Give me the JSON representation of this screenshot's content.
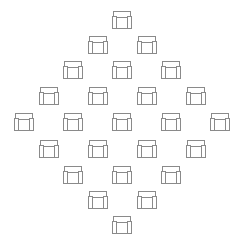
{
  "canvas": {
    "width": 245,
    "height": 237,
    "background_color": "#ffffff",
    "stroke_color": "#8a8a8a"
  },
  "pattern": {
    "name": "armchair-diamond-grid",
    "icon_semantic_name": "armchair-icon",
    "icon_count": 25,
    "rows_per_count": [
      1,
      2,
      3,
      4,
      5,
      4,
      3,
      2,
      1
    ],
    "column_spacing_px": 49,
    "row_spacing_px": 25,
    "icon_width_px": 22,
    "icon_height_px": 21,
    "center_x_px": 122,
    "first_row_y_px": 10
  },
  "icons": [
    {
      "id": "icon-r1-c1",
      "row": 1,
      "col": 1,
      "x": 111,
      "y": 10,
      "label": "armchair"
    },
    {
      "id": "icon-r2-c1",
      "row": 2,
      "col": 1,
      "x": 87,
      "y": 35,
      "label": "armchair"
    },
    {
      "id": "icon-r2-c2",
      "row": 2,
      "col": 2,
      "x": 136,
      "y": 35,
      "label": "armchair"
    },
    {
      "id": "icon-r3-c1",
      "row": 3,
      "col": 1,
      "x": 62,
      "y": 60,
      "label": "armchair"
    },
    {
      "id": "icon-r3-c2",
      "row": 3,
      "col": 2,
      "x": 111,
      "y": 60,
      "label": "armchair"
    },
    {
      "id": "icon-r3-c3",
      "row": 3,
      "col": 3,
      "x": 160,
      "y": 60,
      "label": "armchair"
    },
    {
      "id": "icon-r4-c1",
      "row": 4,
      "col": 1,
      "x": 38,
      "y": 86,
      "label": "armchair"
    },
    {
      "id": "icon-r4-c2",
      "row": 4,
      "col": 2,
      "x": 87,
      "y": 86,
      "label": "armchair"
    },
    {
      "id": "icon-r4-c3",
      "row": 4,
      "col": 3,
      "x": 136,
      "y": 86,
      "label": "armchair"
    },
    {
      "id": "icon-r4-c4",
      "row": 4,
      "col": 4,
      "x": 185,
      "y": 86,
      "label": "armchair"
    },
    {
      "id": "icon-r5-c1",
      "row": 5,
      "col": 1,
      "x": 13,
      "y": 112,
      "label": "armchair"
    },
    {
      "id": "icon-r5-c2",
      "row": 5,
      "col": 2,
      "x": 62,
      "y": 112,
      "label": "armchair"
    },
    {
      "id": "icon-r5-c3",
      "row": 5,
      "col": 3,
      "x": 111,
      "y": 112,
      "label": "armchair"
    },
    {
      "id": "icon-r5-c4",
      "row": 5,
      "col": 4,
      "x": 160,
      "y": 112,
      "label": "armchair"
    },
    {
      "id": "icon-r5-c5",
      "row": 5,
      "col": 5,
      "x": 209,
      "y": 112,
      "label": "armchair"
    },
    {
      "id": "icon-r6-c1",
      "row": 6,
      "col": 1,
      "x": 38,
      "y": 139,
      "label": "armchair"
    },
    {
      "id": "icon-r6-c2",
      "row": 6,
      "col": 2,
      "x": 87,
      "y": 139,
      "label": "armchair"
    },
    {
      "id": "icon-r6-c3",
      "row": 6,
      "col": 3,
      "x": 136,
      "y": 139,
      "label": "armchair"
    },
    {
      "id": "icon-r6-c4",
      "row": 6,
      "col": 4,
      "x": 185,
      "y": 139,
      "label": "armchair"
    },
    {
      "id": "icon-r7-c1",
      "row": 7,
      "col": 1,
      "x": 62,
      "y": 165,
      "label": "armchair"
    },
    {
      "id": "icon-r7-c2",
      "row": 7,
      "col": 2,
      "x": 111,
      "y": 165,
      "label": "armchair"
    },
    {
      "id": "icon-r7-c3",
      "row": 7,
      "col": 3,
      "x": 160,
      "y": 165,
      "label": "armchair"
    },
    {
      "id": "icon-r8-c1",
      "row": 8,
      "col": 1,
      "x": 87,
      "y": 190,
      "label": "armchair"
    },
    {
      "id": "icon-r8-c2",
      "row": 8,
      "col": 2,
      "x": 136,
      "y": 190,
      "label": "armchair"
    },
    {
      "id": "icon-r9-c1",
      "row": 9,
      "col": 1,
      "x": 111,
      "y": 215,
      "label": "armchair"
    }
  ]
}
